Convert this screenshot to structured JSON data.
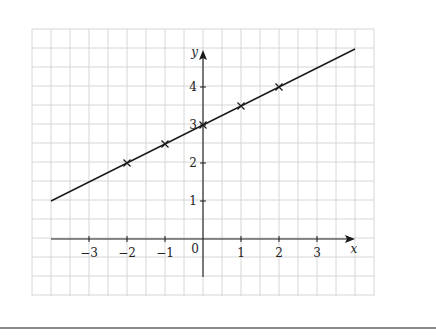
{
  "chart_data": {
    "type": "line",
    "title": "",
    "xlabel": "x",
    "ylabel": "y",
    "xlim": [
      -4,
      4
    ],
    "ylim": [
      -1,
      5
    ],
    "grid": true,
    "grid_step": 0.5,
    "x_ticks": [
      -3,
      -2,
      -1,
      1,
      2,
      3
    ],
    "x_tick_labels": [
      "−3",
      "−2",
      "−1",
      "1",
      "2",
      "3"
    ],
    "y_ticks": [
      1,
      2,
      3,
      4
    ],
    "y_tick_labels": [
      "1",
      "2",
      "3",
      "4"
    ],
    "origin_label": "0",
    "series": [
      {
        "name": "y = 0.5x + 3",
        "line": {
          "x": [
            -4,
            4
          ],
          "y": [
            1,
            5
          ]
        },
        "points": {
          "x": [
            -2,
            -1,
            0,
            1,
            2
          ],
          "y": [
            2,
            2.5,
            3,
            3.5,
            4
          ]
        },
        "marker": "x"
      }
    ],
    "colors": {
      "grid": "#d6d6d6",
      "ink": "#1a1a1a"
    }
  }
}
